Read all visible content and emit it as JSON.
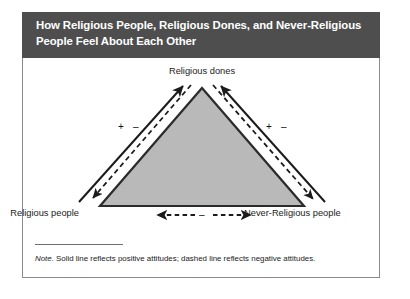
{
  "figure": {
    "header_title": "How Religious People, Religious Dones, and Never-Religious People Feel About Each Other",
    "header_bg_color": "#4e4e4e",
    "header_text_color": "#ffffff",
    "card_border_color": "#8a8a8a",
    "triangle_fill_color": "#b9b9b9",
    "triangle_stroke_color": "#2b2b2b"
  },
  "diagram": {
    "apex_label": "Religious dones",
    "left_label": "Religious people",
    "right_label": "Never-Religious people",
    "signs": {
      "left_positive": "+",
      "left_negative": "–",
      "right_positive": "+",
      "right_negative": "–",
      "bottom_negative": "–"
    }
  },
  "note": {
    "lead": "Note.",
    "text": " Solid line reflects positive attitudes; dashed line reflects negative attitudes."
  }
}
